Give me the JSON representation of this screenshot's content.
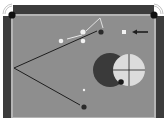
{
  "diagram": {
    "type": "billiards-shot-diagram",
    "colors": {
      "background": "#ffffff",
      "rail": "#3c3c3c",
      "rail_edge": "#b4b4b4",
      "felt": "#8e8e8e",
      "pocket": "#111111",
      "line_dark": "#1e1e1e",
      "line_light": "#e8e8e8",
      "ghost_dark": "#3a3a3a",
      "ghost_light": "#dcdcdc",
      "cue_ball": "#f2f2f2",
      "object_ball": "#2a2a2a"
    },
    "pockets": [
      {
        "name": "top-left-pocket",
        "x": 12,
        "y": 15
      },
      {
        "name": "top-right-pocket",
        "x": 154,
        "y": 15
      }
    ],
    "balls": [
      {
        "name": "white-ball-1",
        "x": 61,
        "y": 41,
        "r": 2.3,
        "fill": "#f2f2f2"
      },
      {
        "name": "white-ball-2",
        "x": 83,
        "y": 32,
        "r": 2.6,
        "fill": "#f2f2f2"
      },
      {
        "name": "white-ball-3",
        "x": 83,
        "y": 41,
        "r": 2.3,
        "fill": "#f2f2f2"
      },
      {
        "name": "object-ball-top",
        "x": 101,
        "y": 32,
        "r": 2.6,
        "fill": "#2a2a2a"
      },
      {
        "name": "object-ball-bottom",
        "x": 84,
        "y": 107,
        "r": 2.6,
        "fill": "#2a2a2a"
      },
      {
        "name": "contact-ball",
        "x": 121,
        "y": 82,
        "r": 2.8,
        "fill": "#1a1a1a"
      },
      {
        "name": "small-marker",
        "x": 84,
        "y": 90,
        "r": 1.2,
        "fill": "#f2f2f2"
      }
    ],
    "square_marker": {
      "x": 122,
      "y": 30,
      "size": 4
    },
    "arrow": {
      "x1": 148,
      "y1": 32,
      "x2": 133,
      "y2": 32
    },
    "lines_dark": [
      {
        "x1": 14,
        "y1": 68,
        "x2": 97,
        "y2": 31
      },
      {
        "x1": 14,
        "y1": 68,
        "x2": 80,
        "y2": 105
      }
    ],
    "lines_light": [
      {
        "points": "67,39 82,35"
      },
      {
        "points": "86,31 100,18 103,28"
      }
    ],
    "ghost_circles": {
      "dark": {
        "cx": 110,
        "cy": 70,
        "r": 17
      },
      "light": {
        "cx": 129,
        "cy": 70,
        "r": 16
      }
    }
  }
}
